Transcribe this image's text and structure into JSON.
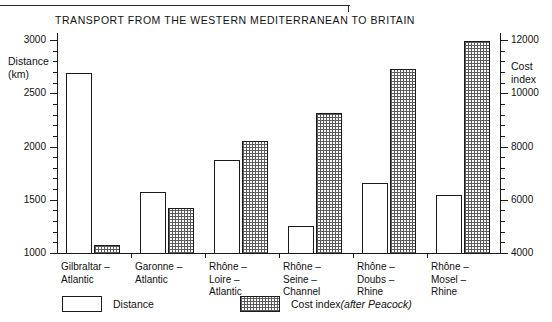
{
  "chart_data": {
    "type": "bar",
    "title": "TRANSPORT FROM THE WESTERN MEDITERRANEAN TO BRITAIN",
    "xlabel": "",
    "categories": [
      "Gilbraltar –\nAtlantic",
      "Garonne –\nAtlantic",
      "Rhône –\nLoire –\nAtlantic",
      "Rhône –\nSeine –\nChannel",
      "Rhône –\nDoubs –\nRhine",
      "Rhône –\nMosel –\nRhine"
    ],
    "series": [
      {
        "name": "Distance",
        "axis": "left",
        "values": [
          2700,
          1580,
          1880,
          1265,
          1665,
          1555
        ]
      },
      {
        "name": "Cost index (after Peacock)",
        "axis": "right",
        "values": [
          4350,
          5740,
          8240,
          9300,
          10960,
          12000
        ]
      }
    ],
    "y_left": {
      "label": "Distance\n(km)",
      "label_line1": "Distance",
      "label_line2": "(km)",
      "ylim": [
        1000,
        3000
      ],
      "major_ticks": [
        1000,
        1500,
        2000,
        2500,
        3000
      ],
      "tick_labels": [
        "1000",
        "1500",
        "2000",
        "2500",
        "3000"
      ],
      "minor_step": 100
    },
    "y_right": {
      "label": "Cost\nindex",
      "label_line1": "Cost",
      "label_line2": "index",
      "ylim": [
        4000,
        12000
      ],
      "major_ticks": [
        4000,
        6000,
        8000,
        10000,
        12000
      ],
      "tick_labels": [
        "4000",
        "6000",
        "8000",
        "10000",
        "12000"
      ],
      "minor_step": 400
    },
    "grid": false,
    "legend_position": "bottom",
    "legend": [
      {
        "key": "distance",
        "label": "Distance",
        "swatch": "outline"
      },
      {
        "key": "cost",
        "label_plain": "Cost index ",
        "label_italic": "(after Peacock)",
        "swatch": "stippled"
      }
    ]
  },
  "colors": {
    "ink": "#1b1b1b",
    "distance_fill": "#ffffff",
    "cost_fill": "#5c5c5c",
    "background": "#ffffff"
  }
}
